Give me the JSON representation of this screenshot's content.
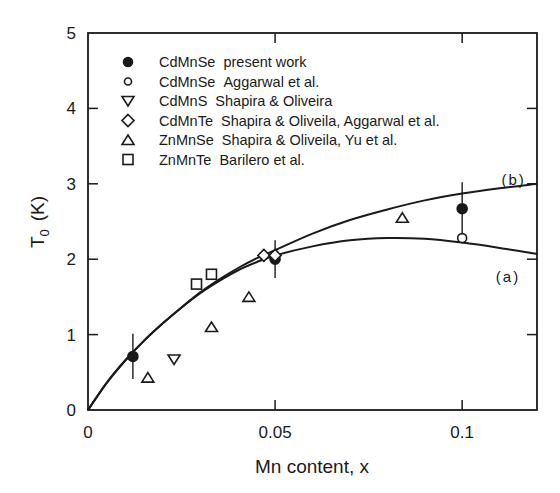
{
  "chart_data": {
    "type": "scatter",
    "title": "",
    "xlabel": "Mn content, x",
    "ylabel": "T0 (K)",
    "ylabel_main": "T",
    "ylabel_sub": "0",
    "ylabel_unit": "(K)",
    "xlim": [
      0,
      0.12
    ],
    "ylim": [
      0,
      5
    ],
    "grid": false,
    "legend_position": "upper-left-inside",
    "x_ticks": [
      {
        "value": 0,
        "label": "0"
      },
      {
        "value": 0.05,
        "label": "0.05"
      },
      {
        "value": 0.1,
        "label": "0.1"
      }
    ],
    "y_ticks": [
      {
        "value": 0,
        "label": "0"
      },
      {
        "value": 1,
        "label": "1"
      },
      {
        "value": 2,
        "label": "2"
      },
      {
        "value": 3,
        "label": "3"
      },
      {
        "value": 4,
        "label": "4"
      },
      {
        "value": 5,
        "label": "5"
      }
    ],
    "series": [
      {
        "name": "CdMnSe  present work",
        "compound": "CdMnSe",
        "source": "present work",
        "marker": "filled-circle",
        "points": [
          {
            "x": 0.012,
            "y": 0.71,
            "err": 0.3
          },
          {
            "x": 0.05,
            "y": 2.0,
            "err": 0.25
          },
          {
            "x": 0.1,
            "y": 2.67,
            "err": 0.35
          }
        ]
      },
      {
        "name": "CdMnSe  Aggarwal et al.",
        "compound": "CdMnSe",
        "source": "Aggarwal et al.",
        "marker": "open-circle",
        "points": [
          {
            "x": 0.1,
            "y": 2.28
          }
        ]
      },
      {
        "name": "CdMnS  Shapira & Oliveira",
        "compound": "CdMnS",
        "source": "Shapira & Oliveira",
        "marker": "down-triangle",
        "points": [
          {
            "x": 0.023,
            "y": 0.67
          }
        ]
      },
      {
        "name": "CdMnTe  Shapira & Oliveila, Aggarwal et al.",
        "compound": "CdMnTe",
        "source": "Shapira & Oliveila, Aggarwal et al.",
        "marker": "diamond",
        "points": [
          {
            "x": 0.047,
            "y": 2.05
          },
          {
            "x": 0.05,
            "y": 2.05
          }
        ]
      },
      {
        "name": "ZnMnSe  Shapira & Oliveila, Yu et al.",
        "compound": "ZnMnSe",
        "source": "Shapira & Oliveila, Yu et al.",
        "marker": "up-triangle",
        "points": [
          {
            "x": 0.016,
            "y": 0.43
          },
          {
            "x": 0.033,
            "y": 1.1
          },
          {
            "x": 0.043,
            "y": 1.5
          },
          {
            "x": 0.084,
            "y": 2.55
          }
        ]
      },
      {
        "name": "ZnMnTe  Barilero et al.",
        "compound": "ZnMnTe",
        "source": "Barilero et al.",
        "marker": "square",
        "points": [
          {
            "x": 0.029,
            "y": 1.67
          },
          {
            "x": 0.033,
            "y": 1.8
          }
        ]
      }
    ],
    "curves": [
      {
        "label": "(a)",
        "points": [
          [
            0,
            0
          ],
          [
            0.005,
            0.36
          ],
          [
            0.01,
            0.66
          ],
          [
            0.015,
            0.92
          ],
          [
            0.02,
            1.15
          ],
          [
            0.025,
            1.36
          ],
          [
            0.03,
            1.55
          ],
          [
            0.035,
            1.71
          ],
          [
            0.04,
            1.85
          ],
          [
            0.045,
            1.96
          ],
          [
            0.05,
            2.05
          ],
          [
            0.06,
            2.17
          ],
          [
            0.07,
            2.25
          ],
          [
            0.08,
            2.28
          ],
          [
            0.09,
            2.27
          ],
          [
            0.1,
            2.22
          ],
          [
            0.11,
            2.15
          ],
          [
            0.12,
            2.07
          ]
        ],
        "label_pos": {
          "x": 0.109,
          "y": 1.7
        }
      },
      {
        "label": "(b)",
        "points": [
          [
            0,
            0
          ],
          [
            0.005,
            0.36
          ],
          [
            0.01,
            0.66
          ],
          [
            0.015,
            0.92
          ],
          [
            0.02,
            1.15
          ],
          [
            0.025,
            1.36
          ],
          [
            0.03,
            1.56
          ],
          [
            0.035,
            1.73
          ],
          [
            0.04,
            1.88
          ],
          [
            0.045,
            2.01
          ],
          [
            0.05,
            2.12
          ],
          [
            0.06,
            2.34
          ],
          [
            0.07,
            2.52
          ],
          [
            0.08,
            2.66
          ],
          [
            0.09,
            2.78
          ],
          [
            0.1,
            2.87
          ],
          [
            0.11,
            2.94
          ],
          [
            0.12,
            3.0
          ]
        ],
        "label_pos": {
          "x": 0.1105,
          "y": 2.98
        }
      }
    ]
  }
}
